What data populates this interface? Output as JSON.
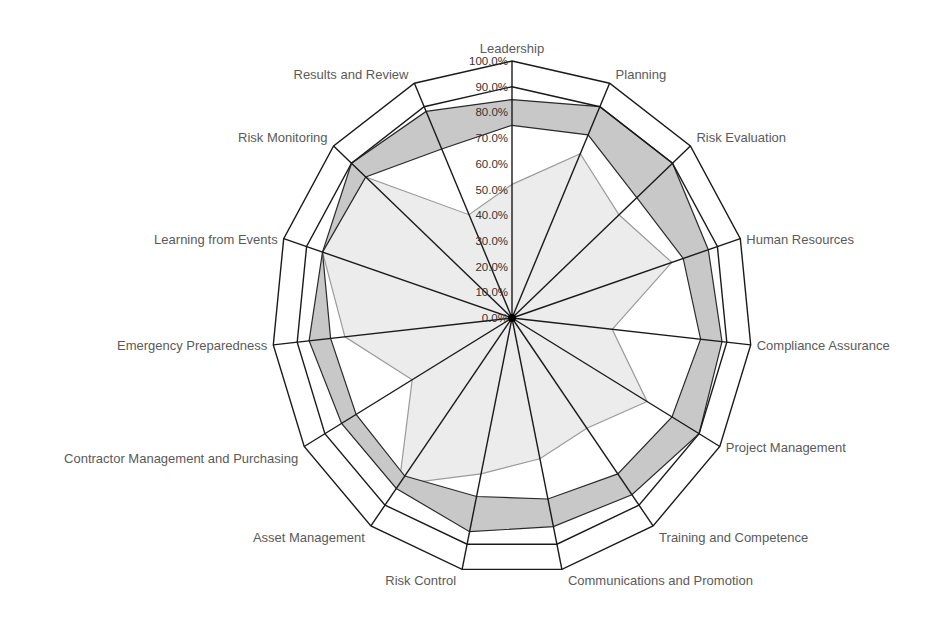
{
  "chart_data": {
    "type": "radar",
    "title": "",
    "axes": [
      "Leadership",
      "Planning",
      "Risk Evaluation",
      "Human Resources",
      "Compliance Assurance",
      "Project Management",
      "Training and Competence",
      "Communications and Promotion",
      "Risk Control",
      "Asset Management",
      "Contractor Management and Purchasing",
      "Emergency Preparedness",
      "Learning from Events",
      "Risk Monitoring",
      "Results and Review"
    ],
    "radial_ticks": [
      "0.0%",
      "10.0%",
      "20.0%",
      "30.0%",
      "40.0%",
      "50.0%",
      "60.0%",
      "70.0%",
      "80.0%",
      "90.0%",
      "100.0%"
    ],
    "rlim": [
      0,
      100
    ],
    "unit": "%",
    "series": [
      {
        "name": "Target range upper",
        "style": "band-outer",
        "values": [
          85,
          90,
          90,
          86,
          88,
          90,
          85,
          83,
          85,
          82,
          82,
          85,
          83,
          90,
          88
        ]
      },
      {
        "name": "Target range lower",
        "style": "band-inner",
        "values": [
          75,
          78,
          70,
          75,
          79,
          77,
          75,
          72,
          71,
          76,
          75,
          76,
          83,
          82,
          72
        ]
      },
      {
        "name": "Score",
        "style": "filled-area",
        "values": [
          52,
          70,
          60,
          70,
          42,
          65,
          53,
          56,
          62,
          80,
          48,
          70,
          83,
          82,
          44
        ]
      }
    ],
    "reference_rings": [
      90,
      100
    ],
    "legend": "none",
    "grid": "spokes only"
  },
  "colors": {
    "band_fill": "#c8c8c8",
    "score_fill": "#ececec",
    "score_stroke": "#9a9a9a",
    "line": "#1a1a1a",
    "label": "#5a5a5a"
  }
}
